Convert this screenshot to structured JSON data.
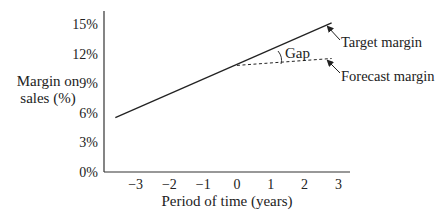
{
  "chart_data": {
    "type": "line",
    "title": "",
    "xlabel": "Period of time (years)",
    "ylabel": "Margin on sales (%)",
    "ylabel_lines": [
      "Margin on",
      "sales (%)"
    ],
    "xlim": [
      -4,
      3
    ],
    "ylim": [
      0,
      16
    ],
    "x_ticks": [
      "−3",
      "−2",
      "−1",
      "0",
      "1",
      "2",
      "3"
    ],
    "x_tick_values": [
      -3,
      -2,
      -1,
      0,
      1,
      2,
      3
    ],
    "y_ticks": [
      "0%",
      "3%",
      "6%",
      "9%",
      "12%",
      "15%"
    ],
    "y_tick_values": [
      0,
      3,
      6,
      9,
      12,
      15
    ],
    "grid": false,
    "series": [
      {
        "name": "Target margin",
        "style": "solid",
        "x": [
          -3.6,
          2.8
        ],
        "y": [
          5.5,
          15.1
        ]
      },
      {
        "name": "Forecast margin",
        "style": "dashed",
        "x": [
          0,
          2.8
        ],
        "y": [
          10.8,
          11.5
        ]
      }
    ],
    "annotations": [
      {
        "text": "Gap",
        "type": "angle-arc",
        "between": [
          "Target margin",
          "Forecast margin"
        ]
      },
      {
        "text": "Target margin",
        "type": "arrow-label",
        "points_to": "Target margin end"
      },
      {
        "text": "Forecast margin",
        "type": "arrow-label",
        "points_to": "Forecast margin end"
      }
    ]
  }
}
